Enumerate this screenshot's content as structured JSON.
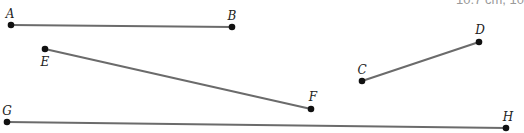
{
  "clipped_caption": "10.7 cm, 10",
  "colors": {
    "segment": "#6b6b6b",
    "point": "#111111",
    "label": "#222222"
  },
  "points": {
    "A": {
      "label": "A",
      "x": 11,
      "y": 25,
      "lx": 10,
      "ly": 18
    },
    "B": {
      "label": "B",
      "x": 232,
      "y": 27,
      "lx": 232,
      "ly": 20
    },
    "C": {
      "label": "C",
      "x": 362,
      "y": 81,
      "lx": 362,
      "ly": 74
    },
    "D": {
      "label": "D",
      "x": 479,
      "y": 42,
      "lx": 480,
      "ly": 34
    },
    "E": {
      "label": "E",
      "x": 45,
      "y": 49,
      "lx": 45,
      "ly": 66
    },
    "F": {
      "label": "F",
      "x": 311,
      "y": 109,
      "lx": 313,
      "ly": 101
    },
    "G": {
      "label": "G",
      "x": 7,
      "y": 122,
      "lx": 7,
      "ly": 115
    },
    "H": {
      "label": "H",
      "x": 506,
      "y": 128,
      "lx": 508,
      "ly": 121
    }
  },
  "segments": [
    {
      "name": "AB",
      "from": "A",
      "to": "B"
    },
    {
      "name": "CD",
      "from": "C",
      "to": "D"
    },
    {
      "name": "EF",
      "from": "E",
      "to": "F"
    },
    {
      "name": "GH",
      "from": "G",
      "to": "H"
    }
  ]
}
